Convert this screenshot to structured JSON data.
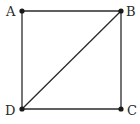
{
  "diagram": {
    "type": "square-with-diagonal",
    "vertices": [
      {
        "id": "A",
        "label": "A",
        "x": 22,
        "y": 11
      },
      {
        "id": "B",
        "label": "B",
        "x": 121,
        "y": 11
      },
      {
        "id": "C",
        "label": "C",
        "x": 121,
        "y": 109
      },
      {
        "id": "D",
        "label": "D",
        "x": 22,
        "y": 109
      }
    ],
    "edges": [
      [
        "A",
        "B"
      ],
      [
        "B",
        "C"
      ],
      [
        "C",
        "D"
      ],
      [
        "D",
        "A"
      ],
      [
        "D",
        "B"
      ]
    ],
    "colors": {
      "stroke": "#2a2a2a",
      "point": "#1a1a1a",
      "background": "#ffffff"
    }
  }
}
